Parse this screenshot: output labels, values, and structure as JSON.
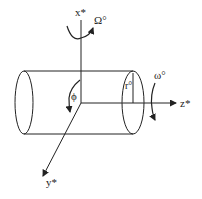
{
  "diagram": {
    "type": "rotating-cylinder-coordinate-system",
    "colors": {
      "stroke": "#222222",
      "background": "#ffffff"
    },
    "labels": {
      "x_axis": "x*",
      "y_axis": "y*",
      "z_axis": "z*",
      "big_omega": "Ω°",
      "small_omega": "ω°",
      "phi": "ϕ",
      "radius": "r°"
    }
  }
}
